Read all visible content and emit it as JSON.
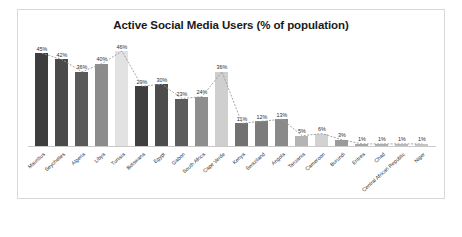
{
  "chart_data": {
    "type": "bar",
    "title": "Active Social Media Users (% of population)",
    "xlabel": "",
    "ylabel": "",
    "ylim": [
      0,
      50
    ],
    "grid": false,
    "legend": false,
    "value_suffix": "%",
    "categories": [
      "Mauritius",
      "Seychelles",
      "Algeria",
      "Libya",
      "Tunisia",
      "Botswana",
      "Egypt",
      "Gabon",
      "South Africa",
      "Cape Verde",
      "Kenya",
      "Swaziland",
      "Angola",
      "Tanzania",
      "Cameroon",
      "Burundi",
      "Eritrea",
      "Chad",
      "Central African Republic",
      "Niger"
    ],
    "values": [
      45,
      42,
      36,
      40,
      46,
      29,
      30,
      23,
      24,
      36,
      11,
      12,
      13,
      5,
      6,
      3,
      1,
      1,
      1,
      1
    ],
    "value_labels": [
      "45%",
      "42%",
      "36%",
      "40%",
      "46%",
      "29%",
      "30%",
      "23%",
      "24%",
      "36%",
      "11%",
      "12%",
      "13%",
      "5%",
      "6%",
      "3%",
      "1%",
      "1%",
      "1%",
      "1%"
    ],
    "bar_colors": [
      "#3d3d3d",
      "#4a4a4a",
      "#5a5a5a",
      "#8c8c8c",
      "#e2e2e2",
      "#3f3f3f",
      "#4c4c4c",
      "#5c5c5c",
      "#8e8e8e",
      "#cfcfcf",
      "#717171",
      "#7c7c7c",
      "#8a8a8a",
      "#b4b4b4",
      "#d2d2d2",
      "#9a9a9a",
      "#a8a8a8",
      "#b0b0b0",
      "#bdbdbd",
      "#c6c6c6"
    ],
    "trendline": {
      "style": "dotted",
      "color": "#9b9b9b",
      "values": [
        45,
        42,
        36,
        40,
        46,
        29,
        30,
        23,
        24,
        36,
        11,
        12,
        13,
        5,
        6,
        3,
        1,
        1,
        1,
        1
      ]
    }
  },
  "frame": {
    "border_color": "#d8d8d8",
    "background": "#ffffff"
  }
}
